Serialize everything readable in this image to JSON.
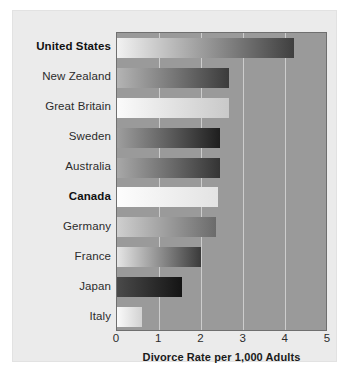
{
  "figure": {
    "background_color": "#ffffff",
    "panel_color": "#ebebeb",
    "plot_background_color": "#9a9a9a",
    "gridline_color": "#d6d6d6",
    "axis_border_color": "#6f6f6f"
  },
  "axis": {
    "x_title": "Divorce Rate per 1,000 Adults",
    "x_ticks": [
      "0",
      "1",
      "2",
      "3",
      "4",
      "5"
    ]
  },
  "chart_data": {
    "type": "bar",
    "orientation": "horizontal",
    "title": "",
    "subtitle": "",
    "xlabel": "Divorce Rate per 1,000 Adults",
    "ylabel": "",
    "xlim": [
      0,
      5
    ],
    "xticks": [
      0,
      1,
      2,
      3,
      4,
      5
    ],
    "grid": true,
    "legend": null,
    "categories": [
      "United States",
      "New Zealand",
      "Great Britain",
      "Sweden",
      "Australia",
      "Canada",
      "Germany",
      "France",
      "Japan",
      "Italy"
    ],
    "values": [
      4.2,
      2.65,
      2.65,
      2.45,
      2.45,
      2.4,
      2.35,
      2.0,
      1.55,
      0.6
    ],
    "emphasized_categories": [
      "United States",
      "Canada"
    ],
    "bars": [
      {
        "label": "United States",
        "value": 4.2,
        "bold_label": true,
        "gradient_start": "#f2f2f2",
        "gradient_end": "#3f3f3f"
      },
      {
        "label": "New Zealand",
        "value": 2.65,
        "bold_label": false,
        "gradient_start": "#b4b4b4",
        "gradient_end": "#3b3b3b"
      },
      {
        "label": "Great Britain",
        "value": 2.65,
        "bold_label": false,
        "gradient_start": "#fbfbfb",
        "gradient_end": "#c9c9c9"
      },
      {
        "label": "Sweden",
        "value": 2.45,
        "bold_label": false,
        "gradient_start": "#9e9e9e",
        "gradient_end": "#1e1e1e"
      },
      {
        "label": "Australia",
        "value": 2.45,
        "bold_label": false,
        "gradient_start": "#a8a8a8",
        "gradient_end": "#343434"
      },
      {
        "label": "Canada",
        "value": 2.4,
        "bold_label": true,
        "gradient_start": "#fdfdfd",
        "gradient_end": "#e3e3e3"
      },
      {
        "label": "Germany",
        "value": 2.35,
        "bold_label": false,
        "gradient_start": "#cfcfcf",
        "gradient_end": "#6b6b6b"
      },
      {
        "label": "France",
        "value": 2.0,
        "bold_label": false,
        "gradient_start": "#e6e6e6",
        "gradient_end": "#3a3a3a"
      },
      {
        "label": "Japan",
        "value": 1.55,
        "bold_label": false,
        "gradient_start": "#4a4a4a",
        "gradient_end": "#141414"
      },
      {
        "label": "Italy",
        "value": 0.6,
        "bold_label": false,
        "gradient_start": "#fafafa",
        "gradient_end": "#d2d2d2"
      }
    ]
  }
}
